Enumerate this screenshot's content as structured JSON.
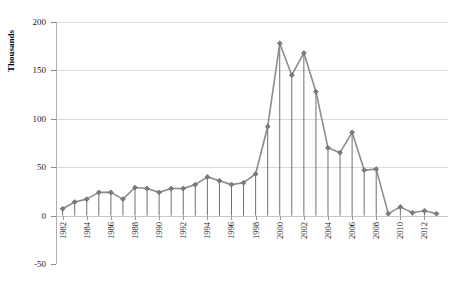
{
  "chart_data": {
    "type": "line",
    "title": "",
    "subtitle": "",
    "xlabel": "",
    "ylabel": "Thousands",
    "ylim": [
      -50,
      200
    ],
    "yticks": [
      200,
      150,
      100,
      50,
      0,
      -50
    ],
    "ytick_labels": [
      "200",
      "150",
      "100",
      "50",
      "0",
      "-50"
    ],
    "grid": true,
    "legend": "none",
    "marker": "diamond",
    "drop_lines": true,
    "line_color": "#8c8c8c",
    "grid_color": "#d9d9d9",
    "x": [
      1982,
      1983,
      1984,
      1985,
      1986,
      1987,
      1988,
      1989,
      1990,
      1991,
      1992,
      1993,
      1994,
      1995,
      1996,
      1997,
      1998,
      1999,
      2000,
      2001,
      2002,
      2003,
      2004,
      2005,
      2006,
      2007,
      2008,
      2009,
      2010,
      2011,
      2012,
      2013
    ],
    "xtick_labels": [
      "1982",
      "1984",
      "1986",
      "1988",
      "1990",
      "1992",
      "1994",
      "1996",
      "1998",
      "2000",
      "2002",
      "2004",
      "2006",
      "2008",
      "2010",
      "2012"
    ],
    "xtick_values": [
      1982,
      1984,
      1986,
      1988,
      1990,
      1992,
      1994,
      1996,
      1998,
      2000,
      2002,
      2004,
      2006,
      2008,
      2010,
      2012
    ],
    "values": [
      7,
      14,
      17,
      24,
      24,
      17,
      29,
      28,
      24,
      28,
      28,
      32,
      40,
      36,
      32,
      34,
      43,
      92,
      178,
      145,
      168,
      128,
      70,
      65,
      86,
      47,
      48,
      2,
      9,
      3,
      5,
      2
    ],
    "series": [
      {
        "name": "series-1",
        "values": [
          7,
          14,
          17,
          24,
          24,
          17,
          29,
          28,
          24,
          28,
          28,
          32,
          40,
          36,
          32,
          34,
          43,
          92,
          178,
          145,
          168,
          128,
          70,
          65,
          86,
          47,
          48,
          2,
          9,
          3,
          5,
          2
        ]
      }
    ]
  }
}
